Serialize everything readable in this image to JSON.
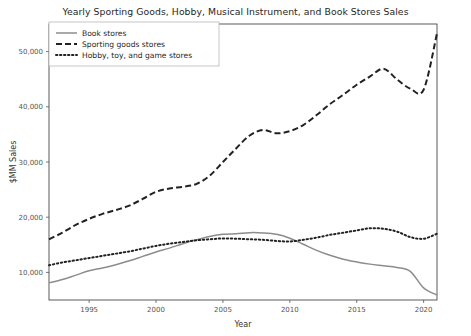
{
  "chart_data": {
    "type": "line",
    "title": "Yearly Sporting Goods, Hobby, Musical Instrument, and Book Stores Sales",
    "xlabel": "Year",
    "ylabel": "$MM Sales",
    "xlim": [
      1992,
      2021
    ],
    "ylim": [
      5000,
      55000
    ],
    "xticks": [
      1995,
      2000,
      2005,
      2010,
      2015,
      2020
    ],
    "xtick_labels": [
      "1995",
      "2000",
      "2005",
      "2010",
      "2015",
      "2020"
    ],
    "yticks": [
      10000,
      20000,
      30000,
      40000,
      50000
    ],
    "ytick_labels": [
      "10,000",
      "20,000",
      "30,000",
      "40,000",
      "50,000"
    ],
    "grid": false,
    "legend_position": "upper left",
    "x": [
      1992,
      1993,
      1994,
      1995,
      1996,
      1997,
      1998,
      1999,
      2000,
      2001,
      2002,
      2003,
      2004,
      2005,
      2006,
      2007,
      2008,
      2009,
      2010,
      2011,
      2012,
      2013,
      2014,
      2015,
      2016,
      2017,
      2018,
      2019,
      2020,
      2021
    ],
    "series": [
      {
        "name": "Book stores",
        "style": "solid",
        "color": "#8c8c8c",
        "values": [
          8100,
          8700,
          9500,
          10300,
          10800,
          11400,
          12100,
          12900,
          13700,
          14400,
          15200,
          15900,
          16500,
          16900,
          17000,
          17200,
          17150,
          16900,
          16200,
          15100,
          14000,
          13100,
          12400,
          11900,
          11500,
          11200,
          10900,
          10200,
          7200,
          5900
        ]
      },
      {
        "name": "Sporting goods stores",
        "style": "dashed",
        "color": "#222222",
        "values": [
          16000,
          17200,
          18600,
          19700,
          20600,
          21300,
          22100,
          23300,
          24600,
          25200,
          25500,
          26000,
          27500,
          30000,
          32500,
          34800,
          35800,
          35200,
          35600,
          36700,
          38500,
          40500,
          42200,
          44000,
          45500,
          46900,
          45000,
          43300,
          43100,
          53300
        ]
      },
      {
        "name": "Hobby, toy, and game stores",
        "style": "dotted",
        "color": "#222222",
        "values": [
          11300,
          11800,
          12200,
          12600,
          13000,
          13400,
          13800,
          14300,
          14800,
          15200,
          15500,
          15800,
          16000,
          16150,
          16100,
          16000,
          15900,
          15700,
          15600,
          15900,
          16300,
          16800,
          17200,
          17600,
          18000,
          17900,
          17400,
          16400,
          16100,
          17000
        ]
      }
    ]
  },
  "legend": {
    "items": [
      {
        "label": "Book stores"
      },
      {
        "label": "Sporting goods stores"
      },
      {
        "label": "Hobby, toy, and game stores"
      }
    ]
  }
}
